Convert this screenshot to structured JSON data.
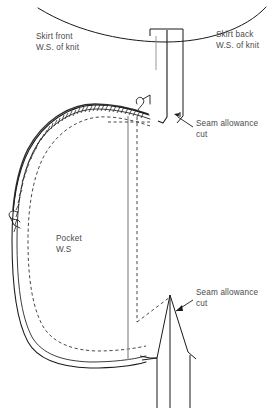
{
  "figure": {
    "type": "technical-sewing-pattern-illustration",
    "background_color": "#ffffff",
    "line_color": "#1a1a1a",
    "text_color": "#4a4a4a"
  },
  "labels": {
    "skirt_front": {
      "line1": "Skirt front",
      "line2": "W.S. of knit"
    },
    "skirt_back": {
      "line1": "Skirt back",
      "line2": "W.S. of knit"
    },
    "pocket": {
      "line1": "Pocket",
      "line2": "W.S"
    },
    "seam_allowance_top": {
      "line1": "Seam allowance",
      "line2": "cut"
    },
    "seam_allowance_bottom": {
      "line1": "Seam allowance",
      "line2": "cut"
    }
  },
  "elements": {
    "waistline": "curved-waist-edge",
    "back_strip": "vertical-skirt-back-strip",
    "pocket_bag": "curved-pocket-outline",
    "pocket_stitching": "serged-overlock-edge",
    "pocket_seamline": "dashed-stitch-line",
    "fold_line": "dashed-vertical-fold-line",
    "side_seam": "solid-vertical-side-seam",
    "notch_point": "triangular-notch-peak",
    "thread_tail_upper": "thread-tail-mark",
    "thread_tail_left": "thread-tail-mark",
    "leader_line_top": "callout-leader-line",
    "leader_line_bottom": "callout-leader-line"
  }
}
